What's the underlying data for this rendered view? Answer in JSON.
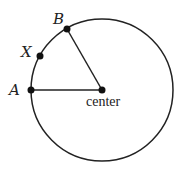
{
  "diagram": {
    "type": "circle-with-sector",
    "circle": {
      "cx": 102,
      "cy": 90,
      "r": 71,
      "stroke": "#222222"
    },
    "points": [
      {
        "id": "A",
        "label": "A",
        "x": 31,
        "y": 90
      },
      {
        "id": "B",
        "label": "B",
        "x": 67,
        "y": 29
      },
      {
        "id": "X",
        "label": "X",
        "x": 40,
        "y": 56
      },
      {
        "id": "center",
        "label": "center",
        "x": 102,
        "y": 90
      }
    ],
    "segments": [
      {
        "from": "A",
        "to": "center"
      },
      {
        "from": "B",
        "to": "center"
      }
    ],
    "labels": {
      "A": "A",
      "B": "B",
      "X": "X",
      "center": "center"
    }
  }
}
